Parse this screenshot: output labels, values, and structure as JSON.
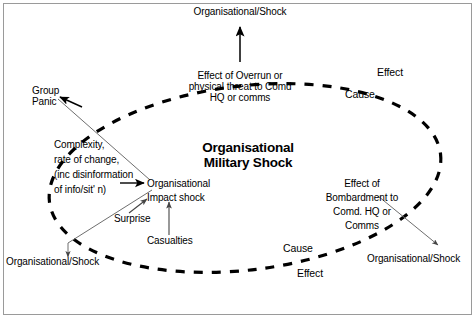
{
  "figure": {
    "kind": "cause-effect-ellipse-diagram",
    "background_color": "#ffffff",
    "border_color": "#9a9a9a",
    "ink_color": "#000000"
  },
  "center": {
    "line1": "Organisational",
    "line2": "Military Shock"
  },
  "nodes": {
    "top_outcome": "Organisational/Shock",
    "bottom_left_outcome": "Organisational/Shock",
    "bottom_right_outcome": "Organisational/Shock",
    "group_panic_line1": "Group",
    "group_panic_line2": "Panic",
    "impact_line1": "Organisational",
    "impact_line2": "Impact shock",
    "surprise": "Surprise",
    "casualties": "Casualties"
  },
  "blocks": {
    "overrun": {
      "line1": "Effect of Overrun or",
      "line2": "physical threat to Comd",
      "line3": "HQ or comms"
    },
    "complexity": {
      "line1": "Complexity,",
      "line2": "rate of change,",
      "line3": "(inc disinformation",
      "line4": "of info/sit' n)"
    },
    "bombardment": {
      "line1": "Effect of",
      "line2": "Bombardment to",
      "line3": "Comd. HQ or",
      "line4": "Comms"
    }
  },
  "annotations": {
    "top_right_effect": "Effect",
    "top_right_cause": "Cause",
    "bottom_right_cause": "Cause",
    "bottom_right_effect": "Effect"
  }
}
